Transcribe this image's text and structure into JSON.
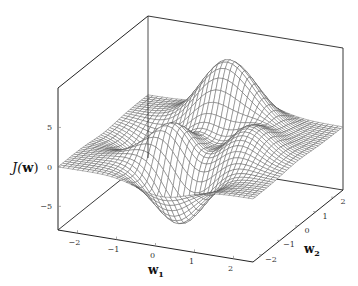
{
  "chart_data": {
    "type": "surface-mesh",
    "function": "peaks",
    "title": "",
    "xlabel": "w1",
    "ylabel": "w2",
    "zlabel": "J(w)",
    "xlim": [
      -2.5,
      2.5
    ],
    "ylim": [
      -2.5,
      2.5
    ],
    "zlim": [
      -8,
      10
    ],
    "xticks": [
      -2,
      -1,
      0,
      1,
      2
    ],
    "yticks": [
      -2,
      -1,
      0,
      1,
      2
    ],
    "zticks": [
      -5,
      0,
      5
    ],
    "xtick_labels": [
      "−2",
      "−1",
      "0",
      "1",
      "2"
    ],
    "ytick_labels": [
      "−2",
      "−1",
      "0",
      "1",
      "2"
    ],
    "ztick_labels": [
      "−5",
      "0",
      "5"
    ],
    "grid_resolution": 41,
    "mesh_color": "#555555",
    "box": true,
    "grid": false,
    "legend": "none"
  },
  "labels": {
    "x_main": "w",
    "x_sub": "1",
    "y_main": "w",
    "y_sub": "2",
    "z_func": "J(",
    "z_arg": "w",
    "z_close": ")"
  }
}
